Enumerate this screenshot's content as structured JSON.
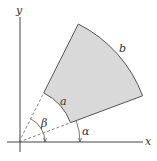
{
  "diagram": {
    "title": "",
    "labels": {
      "x_axis": "x",
      "y_axis": "y",
      "inner_radius": "a",
      "outer_radius": "b",
      "angle_alpha": "α",
      "angle_beta": "β"
    },
    "colors": {
      "fill": "#d9d9d9",
      "stroke": "#555555",
      "axis": "#444444",
      "dashed": "#666666"
    },
    "geometry": {
      "origin": [
        19,
        142
      ],
      "inner_radius_px": 55,
      "outer_radius_px": 132,
      "alpha_deg": 20.5,
      "beta_deg": 63.3
    }
  }
}
